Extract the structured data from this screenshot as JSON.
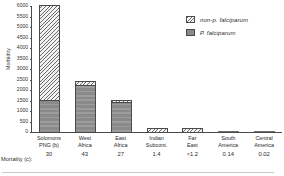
{
  "chart_data": {
    "type": "bar",
    "stacked": true,
    "title": "",
    "xlabel": "",
    "ylabel": "Morbidity",
    "ylim": [
      0,
      6000
    ],
    "yticks": [
      0,
      500,
      1000,
      1500,
      2000,
      2500,
      3000,
      3500,
      4000,
      4500,
      5000,
      5500,
      6000
    ],
    "grid": false,
    "legend_position": "top-right",
    "categories": [
      "Solomons PNG (b)",
      "West Africa",
      "East Africa",
      "Indian Subcont.",
      "Far East",
      "South America",
      "Central America"
    ],
    "category_lines": [
      [
        "Solomons",
        "PNG (b)"
      ],
      [
        "West",
        "Africa"
      ],
      [
        "East",
        "Africa"
      ],
      [
        "Indian",
        "Subcont."
      ],
      [
        "Far",
        "East"
      ],
      [
        "South",
        "America"
      ],
      [
        "Central",
        "America"
      ]
    ],
    "series": [
      {
        "name": "P. falciparum",
        "fill": "solid",
        "color": "#8a8a8a",
        "values": [
          1500,
          2200,
          1400,
          0,
          0,
          0,
          0
        ]
      },
      {
        "name": "non-p. falciparum",
        "fill": "hatched",
        "color": "#f2f2f2",
        "values": [
          4500,
          200,
          100,
          200,
          200,
          0,
          0
        ]
      }
    ],
    "totals": [
      6000,
      2400,
      1500,
      200,
      200,
      0,
      0
    ],
    "mortality_row": {
      "label": "Mortality  (c):",
      "values": [
        "30",
        "43",
        "27",
        "1.4",
        "<1.2",
        "0.14",
        "0.02"
      ]
    }
  },
  "legend": {
    "items": [
      {
        "label": "non-p. falciparum",
        "swatch": "hatched-swatch"
      },
      {
        "label": "P. falciparum",
        "swatch": "solid-swatch"
      }
    ]
  },
  "axes": {
    "y_title": "Morbidity"
  }
}
